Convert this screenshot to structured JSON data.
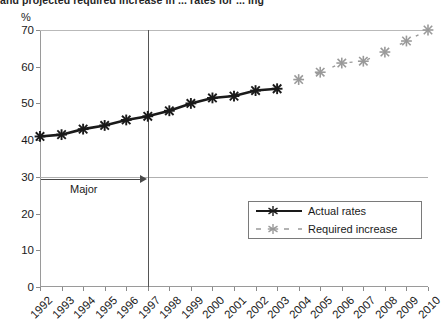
{
  "title": "and projected required increase in ... rates for ... ing",
  "axis": {
    "y_unit_label": "%",
    "y_ticks": [
      0,
      10,
      20,
      30,
      40,
      50,
      60,
      70
    ],
    "y_min": 0,
    "y_max": 70,
    "x_ticks": [
      "1992",
      "1993",
      "1994",
      "1995",
      "1996",
      "1997",
      "1998",
      "1999",
      "2000",
      "2001",
      "2002",
      "2003",
      "2004",
      "2005",
      "2006",
      "2007",
      "2008",
      "2009",
      "2010"
    ]
  },
  "annotation": {
    "label": "Major",
    "marker_year": "1997"
  },
  "legend": {
    "items": [
      {
        "label": "Actual rates",
        "style": "solid",
        "color": "#1a1a1a",
        "marker": "asterisk"
      },
      {
        "label": "Required increase",
        "style": "dashed",
        "color": "#9a9a9a",
        "marker": "asterisk"
      }
    ]
  },
  "chart_data": {
    "type": "line",
    "title": "and projected required increase in ... rates for ... ing",
    "xlabel": "",
    "ylabel": "%",
    "ylim": [
      0,
      70
    ],
    "grid": false,
    "legend_position": "bottom-right",
    "x": [
      "1992",
      "1993",
      "1994",
      "1995",
      "1996",
      "1997",
      "1998",
      "1999",
      "2000",
      "2001",
      "2002",
      "2003",
      "2004",
      "2005",
      "2006",
      "2007",
      "2008",
      "2009",
      "2010"
    ],
    "series": [
      {
        "name": "Actual rates",
        "color": "#1a1a1a",
        "style": "solid",
        "x": [
          "1992",
          "1993",
          "1994",
          "1995",
          "1996",
          "1997",
          "1998",
          "1999",
          "2000",
          "2001",
          "2002",
          "2003"
        ],
        "values": [
          41,
          41.5,
          43,
          44,
          45.5,
          46.5,
          48,
          50,
          51.5,
          52,
          53.5,
          54
        ]
      },
      {
        "name": "Required increase",
        "color": "#9a9a9a",
        "style": "dashed",
        "x": [
          "2004",
          "2005",
          "2006",
          "2007",
          "2008",
          "2009",
          "2010"
        ],
        "values": [
          56.5,
          58.5,
          61,
          61.5,
          64,
          67,
          70
        ]
      }
    ]
  }
}
